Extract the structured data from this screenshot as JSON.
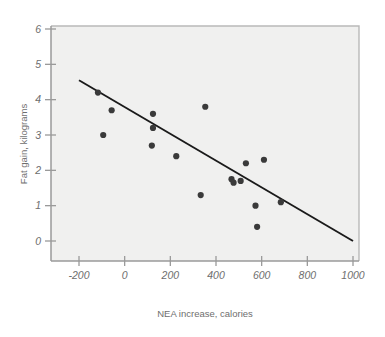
{
  "chart_data": {
    "type": "scatter",
    "title": "",
    "subtitle": "",
    "xlabel": "NEA increase, calories",
    "ylabel": "Fat gain, kilograms",
    "xlim": [
      -300,
      1050
    ],
    "ylim": [
      -1.1,
      6.4
    ],
    "xticks": [
      -200,
      0,
      200,
      400,
      600,
      800,
      1000
    ],
    "xtick_labels": [
      "-200",
      "0",
      "200",
      "400",
      "600",
      "800",
      "1000"
    ],
    "yticks": [
      0,
      1,
      2,
      3,
      4,
      5,
      6
    ],
    "ytick_labels": [
      "0",
      "1",
      "2",
      "3",
      "4",
      "5",
      "6"
    ],
    "grid": false,
    "legend": null,
    "legend_position": "none",
    "marker_color": "#3a3a3a",
    "marker_size": 3.1,
    "line_color": "#1a1a1a",
    "plot_background": "#f0f0ef",
    "frame_color": "#9a9a9a",
    "points": [
      {
        "x": -117,
        "y": 4.2
      },
      {
        "x": -94,
        "y": 3.0
      },
      {
        "x": -57,
        "y": 3.7
      },
      {
        "x": 124,
        "y": 3.6
      },
      {
        "x": 124,
        "y": 3.2
      },
      {
        "x": 119,
        "y": 2.7
      },
      {
        "x": 226,
        "y": 2.4
      },
      {
        "x": 333,
        "y": 1.3
      },
      {
        "x": 353,
        "y": 3.8
      },
      {
        "x": 468,
        "y": 1.75
      },
      {
        "x": 477,
        "y": 1.65
      },
      {
        "x": 508,
        "y": 1.7
      },
      {
        "x": 531,
        "y": 2.2
      },
      {
        "x": 573,
        "y": 1.0
      },
      {
        "x": 580,
        "y": 0.4
      },
      {
        "x": 610,
        "y": 2.3
      },
      {
        "x": 684,
        "y": 1.1
      }
    ],
    "fit_line": {
      "label": "least-squares regression line",
      "slope": -0.00379,
      "intercept": 3.79,
      "endpoints": [
        {
          "x": -200,
          "y": 4.55
        },
        {
          "x": 1000,
          "y": 0.0
        }
      ]
    }
  }
}
